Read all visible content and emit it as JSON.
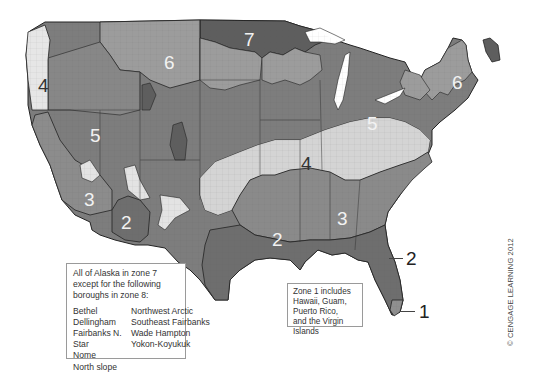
{
  "map": {
    "title": "US climate zone map",
    "zone_colors": {
      "zone1": "#8f8f8f",
      "zone2": "#7a7a7a",
      "zone3": "#8c8c8c",
      "zone4": "#e3e3e3",
      "zone4_marine": "#e6e6e6",
      "zone5": "#7d7d7d",
      "zone6": "#9c9c9c",
      "zone7": "#5e5e5e"
    },
    "zone_labels": [
      {
        "id": "zone-7-north",
        "text": "7"
      },
      {
        "id": "zone-6-west",
        "text": "6"
      },
      {
        "id": "zone-6-northeast",
        "text": "6"
      },
      {
        "id": "zone-4-northwest",
        "text": "4"
      },
      {
        "id": "zone-5-west",
        "text": "5"
      },
      {
        "id": "zone-5-east",
        "text": "5"
      },
      {
        "id": "zone-4-central",
        "text": "4"
      },
      {
        "id": "zone-3-southwest",
        "text": "3"
      },
      {
        "id": "zone-2-arizona",
        "text": "2"
      },
      {
        "id": "zone-3-southeast",
        "text": "3"
      },
      {
        "id": "zone-2-texas",
        "text": "2"
      }
    ],
    "callouts": [
      {
        "id": "callout-zone-2-florida",
        "text": "2"
      },
      {
        "id": "callout-zone-1-florida",
        "text": "1"
      }
    ]
  },
  "notes": {
    "alaska": {
      "heading": "All of Alaska in zone 7 except for the following boroughs in zone 8:",
      "heading_lines": [
        "All of Alaska in zone 7",
        "except for the following",
        "boroughs in zone 8:"
      ],
      "boroughs_col1": [
        "Bethel",
        "Dellingham",
        "Fairbanks N. Star",
        "Nome",
        "North slope"
      ],
      "boroughs_col2": [
        "Northwest Arctic",
        "Southeast Fairbanks",
        "Wade Hampton",
        "Yokon-Koyukuk"
      ]
    },
    "zone1": {
      "lines": [
        "Zone 1 includes",
        "Hawaii, Guam,",
        "Puerto Rico,",
        "and the Virgin Islands"
      ]
    }
  },
  "copyright": "© CENGAGE LEARNING 2012"
}
